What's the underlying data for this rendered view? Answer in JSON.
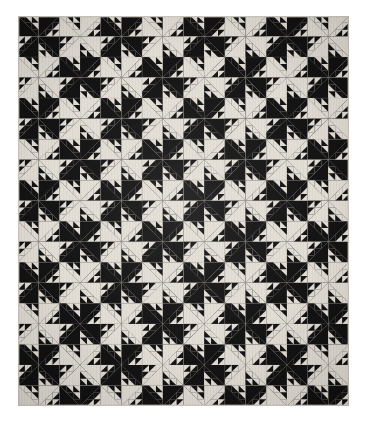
{
  "image": {
    "subject": "patchwork quilt",
    "pattern_name": "Birds in the Air",
    "view": "full quilt, flat frontal",
    "background_color": "#ffffff",
    "canvas_width": 367,
    "canvas_height": 427
  },
  "quilt": {
    "left": 18,
    "top": 16,
    "width": 331,
    "height": 390,
    "columns": 16,
    "rows": 19,
    "unit_px_w": 20.6875,
    "unit_px_h": 20.526,
    "dark_color": "#141414",
    "light_color": "#ded9d1",
    "seam_color": "#8e8a84",
    "binding_color": "#cfcac2",
    "unit_structure": {
      "name": "birds-in-the-air-unit",
      "large_triangle": "half of the square, hypotenuse on the anti-diagonal",
      "small_triangles": 6,
      "small_triangle_grid": 3
    },
    "pinwheel_rotation_degrees": [
      0,
      90,
      180,
      270
    ]
  },
  "colorway": {
    "dark": "#141414",
    "light": "#ded9d1",
    "seam": "#8e8a84",
    "page_background": "#ffffff"
  }
}
